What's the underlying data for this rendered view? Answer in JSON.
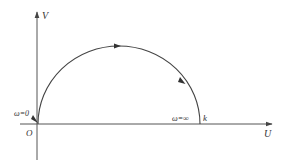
{
  "diagram": {
    "type": "nyquist-plot",
    "colors": {
      "line": "#444444",
      "text": "#333333",
      "background": "#ffffff"
    },
    "axes": {
      "horizontal_label": "U",
      "vertical_label": "V",
      "origin_label": "O"
    },
    "annotations": {
      "start": "ω=0",
      "end": "ω=∞",
      "end_point": "k"
    }
  }
}
